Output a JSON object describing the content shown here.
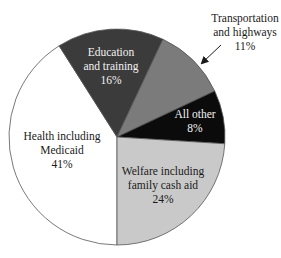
{
  "chart_data": {
    "type": "pie",
    "title": "",
    "start_angle_deg": 180,
    "direction": "clockwise",
    "slices": [
      {
        "label": "Health including Medicaid",
        "label_lines": [
          "Health including",
          "Medicaid",
          "41%"
        ],
        "value": 41,
        "color": "#ffffff",
        "text_color": "dark",
        "label_pos": [
          62,
          140
        ]
      },
      {
        "label": "Education and training",
        "label_lines": [
          "Education",
          "and training",
          "16%"
        ],
        "value": 16,
        "color": "#3b3b3b",
        "text_color": "light",
        "label_pos": [
          111,
          56
        ]
      },
      {
        "label": "Transportation and highways",
        "label_lines": [
          "Transportation",
          "and highways",
          "11%"
        ],
        "value": 11,
        "color": "#7b7b7b",
        "text_color": "dark",
        "label_pos": [
          245,
          22
        ],
        "callout_arrow": {
          "from": [
            221,
            45
          ],
          "to": [
            202,
            63
          ]
        }
      },
      {
        "label": "All other",
        "label_lines": [
          "All other",
          "8%"
        ],
        "value": 8,
        "color": "#0b0b0b",
        "text_color": "light",
        "label_pos": [
          195,
          118
        ]
      },
      {
        "label": "Welfare including family cash aid",
        "label_lines": [
          "Welfare including",
          "family cash aid",
          "24%"
        ],
        "value": 24,
        "color": "#c9c9c9",
        "text_color": "dark",
        "label_pos": [
          163,
          175
        ]
      }
    ],
    "center": [
      117,
      137
    ],
    "radius": 108,
    "legend": "none"
  }
}
